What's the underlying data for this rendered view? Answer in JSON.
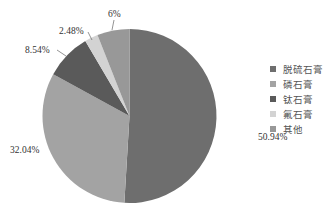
{
  "chart_data": {
    "type": "pie",
    "title": "",
    "categories": [
      "脱硫石膏",
      "磷石膏",
      "钛石膏",
      "氟石膏",
      "其他"
    ],
    "values": [
      50.94,
      32.04,
      8.54,
      2.48,
      6
    ],
    "labels": [
      "50.94%",
      "32.04%",
      "8.54%",
      "2.48%",
      "6%"
    ],
    "colors": [
      "#6e6e6e",
      "#a3a3a3",
      "#5a5a5a",
      "#d3d3d3",
      "#989898"
    ],
    "start_angle_deg": 0,
    "direction": "clockwise",
    "legend_position": "right"
  },
  "legend": {
    "items": [
      {
        "label": "脱硫石膏",
        "color": "#6e6e6e"
      },
      {
        "label": "磷石膏",
        "color": "#a3a3a3"
      },
      {
        "label": "钛石膏",
        "color": "#5a5a5a"
      },
      {
        "label": "氟石膏",
        "color": "#d3d3d3"
      },
      {
        "label": "其他",
        "color": "#989898"
      }
    ]
  }
}
